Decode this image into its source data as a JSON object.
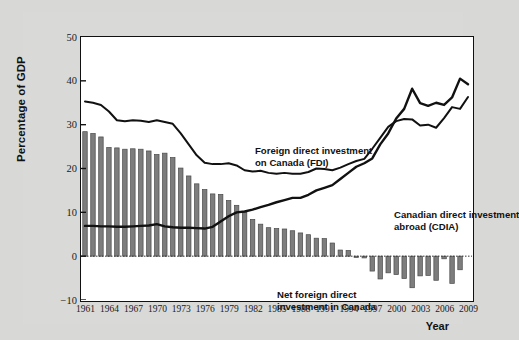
{
  "chart_data": {
    "type": "bar",
    "title": "",
    "xlabel": "Year",
    "ylabel": "Percentage of GDP",
    "ylim": [
      -10,
      50
    ],
    "yticks": [
      50,
      40,
      30,
      20,
      10,
      0,
      -10
    ],
    "xlim": [
      1961,
      2009
    ],
    "xticks": [
      1961,
      1964,
      1967,
      1970,
      1973,
      1976,
      1979,
      1982,
      1985,
      1988,
      1991,
      1994,
      1997,
      2000,
      2003,
      2006,
      2009
    ],
    "grid": false,
    "legend_position": "inline-annotations",
    "x": [
      1961,
      1962,
      1963,
      1964,
      1965,
      1966,
      1967,
      1968,
      1969,
      1970,
      1971,
      1972,
      1973,
      1974,
      1975,
      1976,
      1977,
      1978,
      1979,
      1980,
      1981,
      1982,
      1983,
      1984,
      1985,
      1986,
      1987,
      1988,
      1989,
      1990,
      1991,
      1992,
      1993,
      1994,
      1995,
      1996,
      1997,
      1998,
      1999,
      2000,
      2001,
      2002,
      2003,
      2004,
      2005,
      2006,
      2007,
      2008,
      2009
    ],
    "bars": {
      "name": "Net foreign direct investment in Canada",
      "values": [
        28.4,
        28.0,
        27.2,
        24.8,
        24.7,
        24.4,
        24.5,
        24.4,
        24.0,
        23.2,
        23.5,
        22.5,
        20.1,
        18.3,
        16.5,
        15.2,
        14.2,
        14.1,
        12.7,
        11.6,
        10.0,
        8.4,
        7.3,
        6.5,
        6.3,
        6.2,
        5.8,
        5.3,
        4.9,
        4.1,
        4.0,
        3.0,
        1.4,
        1.3,
        -0.3,
        -0.4,
        -3.4,
        -5.2,
        -3.8,
        -4.2,
        -5.1,
        -7.2,
        -4.5,
        -4.4,
        -5.5,
        -0.6,
        -6.2,
        -3.1,
        0.0
      ],
      "color": "#7d7d7d",
      "edge_color": "#4a4a4a"
    },
    "series": [
      {
        "name": "Foreign direct investment on Canada (FDI)",
        "color": "#111111",
        "values": [
          35.3,
          35.0,
          34.5,
          33.0,
          31.0,
          30.8,
          31.0,
          30.9,
          30.6,
          31.0,
          30.6,
          30.2,
          28.0,
          25.5,
          23.0,
          21.3,
          21.0,
          21.0,
          21.2,
          20.7,
          19.6,
          19.3,
          19.5,
          19.0,
          18.8,
          19.0,
          18.8,
          18.8,
          19.2,
          20.0,
          19.9,
          19.6,
          20.2,
          21.0,
          21.7,
          22.2,
          24.5,
          27.0,
          29.5,
          30.8,
          31.3,
          31.2,
          29.8,
          30.0,
          29.3,
          31.5,
          34.0,
          33.6,
          36.3
        ]
      },
      {
        "name": "Canadian direct investment abroad (CDIA)",
        "color": "#111111",
        "values": [
          6.9,
          6.9,
          6.8,
          6.8,
          6.7,
          6.7,
          6.8,
          6.9,
          7.0,
          7.3,
          6.8,
          6.6,
          6.5,
          6.5,
          6.4,
          6.3,
          6.7,
          7.9,
          9.1,
          10.0,
          10.2,
          10.6,
          11.2,
          11.7,
          12.3,
          12.8,
          13.3,
          13.3,
          14.0,
          15.0,
          15.6,
          16.2,
          17.6,
          19.0,
          20.4,
          21.2,
          22.3,
          25.5,
          28.0,
          31.4,
          33.6,
          38.2,
          34.9,
          34.3,
          35.0,
          34.5,
          36.2,
          40.5,
          39.2
        ]
      }
    ],
    "annotations": [
      {
        "id": "fdi",
        "line1": "Foreign direct investment",
        "line2": "on Canada (FDI)"
      },
      {
        "id": "cdia",
        "line1": "Canadian direct investment",
        "line2": "abroad (CDIA)"
      },
      {
        "id": "net",
        "line1": "Net foreign direct",
        "line2": "investment in Canada"
      }
    ]
  }
}
